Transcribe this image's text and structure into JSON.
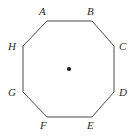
{
  "figure": {
    "type": "regular-octagon-with-center-point",
    "background_color": "#ffffff",
    "stroke_color": "#4a4a4a",
    "stroke_width": 1,
    "label_color": "#2b2b2b",
    "label_style": "italic-serif",
    "center_point": {
      "name": "center-dot",
      "x": 69,
      "y": 69,
      "radius": 2.1,
      "fill": "#1a1a1a"
    },
    "polygon_points": "47,21 92,21 114,46 114,92 92,117 47,117 23,92 23,46",
    "vertices": [
      {
        "id": "A",
        "label": "A",
        "vx": 47,
        "vy": 21,
        "label_x": 39,
        "label_y": 6
      },
      {
        "id": "B",
        "label": "B",
        "vx": 92,
        "vy": 21,
        "label_x": 87,
        "label_y": 6
      },
      {
        "id": "C",
        "label": "C",
        "vx": 114,
        "vy": 46,
        "label_x": 119,
        "label_y": 41
      },
      {
        "id": "D",
        "label": "D",
        "vx": 114,
        "vy": 92,
        "label_x": 119,
        "label_y": 87
      },
      {
        "id": "E",
        "label": "E",
        "vx": 92,
        "vy": 117,
        "label_x": 87,
        "label_y": 120
      },
      {
        "id": "F",
        "label": "F",
        "vx": 47,
        "vy": 117,
        "label_x": 40,
        "label_y": 120
      },
      {
        "id": "G",
        "label": "G",
        "vx": 23,
        "vy": 92,
        "label_x": 8,
        "label_y": 87
      },
      {
        "id": "H",
        "label": "H",
        "vx": 23,
        "vy": 46,
        "label_x": 8,
        "label_y": 41
      }
    ]
  }
}
